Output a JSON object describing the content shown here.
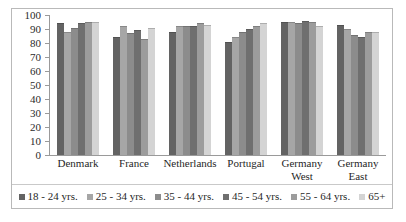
{
  "chart_data": {
    "type": "bar",
    "title": "",
    "subtitle": "",
    "xlabel": "",
    "ylabel": "",
    "ylim": [
      0,
      100
    ],
    "yticks": [
      100,
      90,
      80,
      70,
      60,
      50,
      40,
      30,
      20,
      10,
      0
    ],
    "grid": false,
    "legend_position": "bottom",
    "categories": [
      "Denmark",
      "France",
      "Netherlands",
      "Portugal",
      "Germany West",
      "Germany East"
    ],
    "category_labels": [
      [
        "Denmark"
      ],
      [
        "France"
      ],
      [
        "Netherlands"
      ],
      [
        "Portugal"
      ],
      [
        "Germany",
        "West"
      ],
      [
        "Germany",
        "East"
      ]
    ],
    "series": [
      {
        "name": "18 - 24 yrs.",
        "color": "#636363",
        "values": [
          94,
          84,
          88,
          81,
          95,
          93
        ]
      },
      {
        "name": "25 - 34 yrs.",
        "color": "#a6a6a6",
        "values": [
          88,
          92,
          92,
          84,
          95,
          90
        ]
      },
      {
        "name": "35 - 44 yrs.",
        "color": "#8c8c8c",
        "values": [
          91,
          87,
          92,
          88,
          94,
          86
        ]
      },
      {
        "name": "45 - 54 yrs.",
        "color": "#6f6f6f",
        "values": [
          94,
          89,
          92,
          90,
          96,
          84
        ]
      },
      {
        "name": "55 - 64 yrs.",
        "color": "#9c9c9c",
        "values": [
          95,
          83,
          94,
          92,
          95,
          88
        ]
      },
      {
        "name": "65+",
        "color": "#d4d4d4",
        "values": [
          95,
          91,
          93,
          94,
          92,
          88
        ]
      }
    ]
  }
}
